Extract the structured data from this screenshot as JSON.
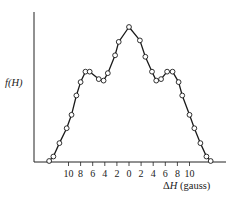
{
  "chart_data": {
    "type": "line",
    "title": "",
    "xlabel": "ΔH (gauss)",
    "ylabel": "f(H)",
    "x_tick_labels": [
      "10",
      "8",
      "6",
      "4",
      "2",
      "0",
      "2",
      "4",
      "6",
      "8",
      "10"
    ],
    "x_ticks": [
      -10,
      -8,
      -6,
      -4,
      -2,
      0,
      2,
      4,
      6,
      8,
      10
    ],
    "xlim": [
      -14,
      14
    ],
    "ylim": [
      0,
      1
    ],
    "grid": false,
    "legend": null,
    "markers": "open-circle",
    "series": [
      {
        "name": "f(H)",
        "x": [
          -13.2,
          -12.5,
          -11.5,
          -10.3,
          -9.5,
          -8.7,
          -8.0,
          -7.2,
          -6.5,
          -5.0,
          -4.2,
          -3.5,
          -2.3,
          -1.7,
          0.0,
          1.8,
          2.7,
          3.8,
          4.5,
          5.3,
          6.3,
          7.2,
          8.2,
          8.8,
          10.0,
          10.8,
          11.8,
          12.8,
          13.5
        ],
        "values": [
          0.0,
          0.03,
          0.12,
          0.22,
          0.31,
          0.44,
          0.53,
          0.6,
          0.6,
          0.55,
          0.54,
          0.59,
          0.71,
          0.8,
          0.9,
          0.81,
          0.7,
          0.6,
          0.54,
          0.55,
          0.6,
          0.6,
          0.53,
          0.44,
          0.31,
          0.22,
          0.12,
          0.03,
          0.0
        ]
      }
    ]
  },
  "labels": {
    "ylabel_text": "f(H)",
    "xlabel_delta": "Δ",
    "xlabel_var": "H",
    "xlabel_unit": " (gauss)"
  }
}
